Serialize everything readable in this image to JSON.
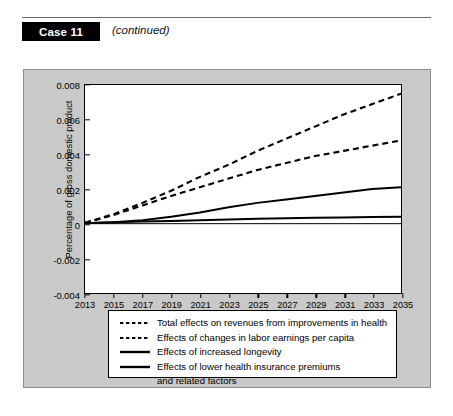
{
  "header": {
    "case_label": "Case 11",
    "continued_label": "(continued)"
  },
  "chart_data": {
    "type": "line",
    "title": "",
    "xlabel": "",
    "ylabel": "Percentage of gross domestic product",
    "xlim": [
      2013,
      2035
    ],
    "ylim": [
      -0.004,
      0.008
    ],
    "grid": false,
    "legend_position": "below",
    "x": [
      2013,
      2015,
      2017,
      2019,
      2021,
      2023,
      2025,
      2027,
      2029,
      2031,
      2033,
      2035
    ],
    "xticklabels": [
      "2013",
      "2015",
      "2017",
      "2019",
      "2021",
      "2023",
      "2025",
      "2027",
      "2029",
      "2031",
      "2033",
      "2035"
    ],
    "yticklabels": [
      "0.008",
      "0.006",
      "0.004",
      "0.002",
      "0",
      "-0.002",
      "-0.004"
    ],
    "yticks": [
      0.008,
      0.006,
      0.004,
      0.002,
      0,
      -0.002,
      -0.004
    ],
    "series": [
      {
        "name": "Total effects on revenues from improvements in health",
        "style": "dashed",
        "values": [
          5e-05,
          0.00055,
          0.0012,
          0.0019,
          0.0027,
          0.0034,
          0.0042,
          0.0049,
          0.0056,
          0.0063,
          0.0069,
          0.0075
        ]
      },
      {
        "name": "Effects of changes in labor earnings per capita",
        "style": "dashed",
        "values": [
          5e-05,
          0.0005,
          0.00105,
          0.0016,
          0.0021,
          0.0026,
          0.0031,
          0.0035,
          0.0039,
          0.0042,
          0.0045,
          0.0048
        ]
      },
      {
        "name": "Effects of increased longevity",
        "style": "solid",
        "values": [
          2e-05,
          8e-05,
          0.0002,
          0.0004,
          0.00065,
          0.00095,
          0.0012,
          0.0014,
          0.0016,
          0.0018,
          0.002,
          0.0021
        ]
      },
      {
        "name": "Effects of lower health insurance premiums and related factors",
        "style": "solid",
        "values": [
          2e-05,
          8e-05,
          0.00012,
          0.00016,
          0.0002,
          0.00024,
          0.00028,
          0.00031,
          0.00034,
          0.00036,
          0.00038,
          0.0004
        ]
      }
    ]
  },
  "legend": {
    "items": [
      {
        "label": "Total effects on revenues from improvements in health",
        "style": "dashed",
        "label2": ""
      },
      {
        "label": "Effects of changes in labor earnings per capita",
        "style": "dashed",
        "label2": ""
      },
      {
        "label": "Effects of increased longevity",
        "style": "solid",
        "label2": ""
      },
      {
        "label": "Effects of lower health insurance premiums",
        "style": "solid",
        "label2": "and related factors"
      }
    ]
  }
}
